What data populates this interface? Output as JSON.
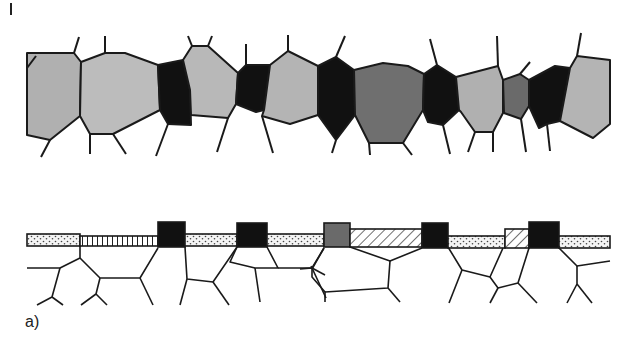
{
  "figure": {
    "panel_label": "a)",
    "colors": {
      "light_gray": "#b4b4b4",
      "medium_gray": "#a0a0a0",
      "dark_gray": "#6e6e6e",
      "black": "#111111",
      "outline": "#1a1a1a",
      "background": "#ffffff"
    },
    "top_row": {
      "description": "polycrystalline grain band with light gray, dark gray and black grains",
      "grain_sequence": [
        "light-gray",
        "light-gray",
        "black",
        "light-gray",
        "black",
        "light-gray",
        "black",
        "dark-gray",
        "black",
        "light-gray",
        "dark-gray",
        "black",
        "light-gray"
      ]
    },
    "bottom_row": {
      "description": "thin surface layer over substrate grains",
      "layer_segments": [
        "dotted",
        "vertical-striped",
        "black-block",
        "dotted",
        "black-block",
        "dotted",
        "dark-gray-block",
        "diagonal-hatched",
        "black-block",
        "dotted",
        "diagonal-hatched",
        "black-block",
        "dotted"
      ]
    }
  }
}
